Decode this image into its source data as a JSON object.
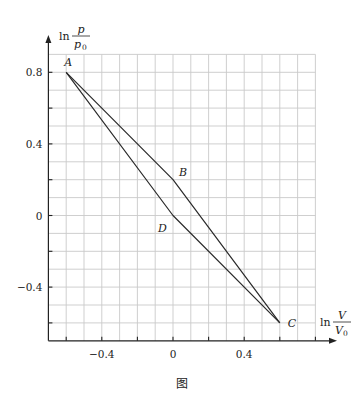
{
  "caption": "图",
  "chart_data": {
    "type": "line",
    "title": "",
    "xlabel": "ln V/V0",
    "ylabel": "ln p/p0",
    "xlabel_parts": {
      "prefix": "ln",
      "num": "V",
      "den": "V",
      "den_sub": "0"
    },
    "ylabel_parts": {
      "prefix": "ln",
      "num": "p",
      "den": "p",
      "den_sub": "0"
    },
    "xlim": [
      -0.7,
      0.8
    ],
    "ylim": [
      -0.7,
      0.9
    ],
    "grid": true,
    "grid_step": 0.1,
    "x_ticks": [
      -0.6,
      -0.4,
      -0.2,
      0,
      0.2,
      0.4,
      0.6,
      0.8
    ],
    "x_tick_labels": [
      {
        "value": -0.4,
        "label": "−0.4"
      },
      {
        "value": 0,
        "label": "0"
      },
      {
        "value": 0.4,
        "label": "0.4"
      }
    ],
    "y_ticks": [
      -0.6,
      -0.4,
      -0.2,
      0,
      0.2,
      0.4,
      0.6,
      0.8
    ],
    "y_tick_labels": [
      {
        "value": 0.8,
        "label": "0.8"
      },
      {
        "value": 0.4,
        "label": "0.4"
      },
      {
        "value": 0,
        "label": "0"
      },
      {
        "value": -0.4,
        "label": "−0.4"
      }
    ],
    "points": [
      {
        "name": "A",
        "x": -0.6,
        "y": 0.8,
        "label_dx": -2,
        "label_dy": -6
      },
      {
        "name": "B",
        "x": 0.0,
        "y": 0.2,
        "label_dx": 6,
        "label_dy": -4
      },
      {
        "name": "C",
        "x": 0.6,
        "y": -0.6,
        "label_dx": 8,
        "label_dy": 4
      },
      {
        "name": "D",
        "x": 0.0,
        "y": 0.0,
        "label_dx": -15,
        "label_dy": 16
      }
    ],
    "series": [
      {
        "name": "A-B-C",
        "path": [
          "A",
          "B",
          "C"
        ],
        "x": [
          -0.6,
          0.0,
          0.6
        ],
        "y": [
          0.8,
          0.2,
          -0.6
        ]
      },
      {
        "name": "A-D-C",
        "path": [
          "A",
          "D",
          "C"
        ],
        "x": [
          -0.6,
          0.0,
          0.6
        ],
        "y": [
          0.8,
          0.0,
          -0.6
        ]
      }
    ],
    "colors": {
      "grid": "#c9c9c9",
      "axis": "#222222",
      "line": "#2a2a2a"
    }
  }
}
